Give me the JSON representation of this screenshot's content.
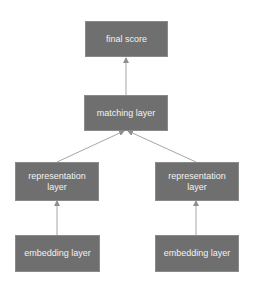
{
  "diagram": {
    "type": "flowchart",
    "direction": "bottom-to-top",
    "colors": {
      "node_fill": "#6f6f6f",
      "node_text": "#f2f2f2",
      "edge": "#a6a6a6",
      "background": "#ffffff"
    },
    "nodes": [
      {
        "id": "final_score",
        "label": "final score"
      },
      {
        "id": "matching_layer",
        "label": "matching layer"
      },
      {
        "id": "representation_layer_left",
        "label": "representation layer"
      },
      {
        "id": "representation_layer_right",
        "label": "representation layer"
      },
      {
        "id": "embedding_layer_left",
        "label": "embedding layer"
      },
      {
        "id": "embedding_layer_right",
        "label": "embedding layer"
      }
    ],
    "edges": [
      {
        "from": "embedding_layer_left",
        "to": "representation_layer_left"
      },
      {
        "from": "embedding_layer_right",
        "to": "representation_layer_right"
      },
      {
        "from": "representation_layer_left",
        "to": "matching_layer"
      },
      {
        "from": "representation_layer_right",
        "to": "matching_layer"
      },
      {
        "from": "matching_layer",
        "to": "final_score"
      }
    ]
  }
}
